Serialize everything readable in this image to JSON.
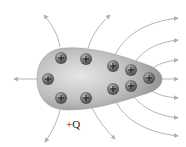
{
  "diagram": {
    "label": "+Q",
    "charge_symbol": "+",
    "charge_count": 10,
    "colors": {
      "conductor_light": "#d9d9d9",
      "conductor_dark": "#8a8a8a",
      "charge_fill": "#6e6e6e",
      "charge_highlight": "#b8b8b8",
      "field_line": "#b0b0b0",
      "label": "#222222"
    }
  }
}
